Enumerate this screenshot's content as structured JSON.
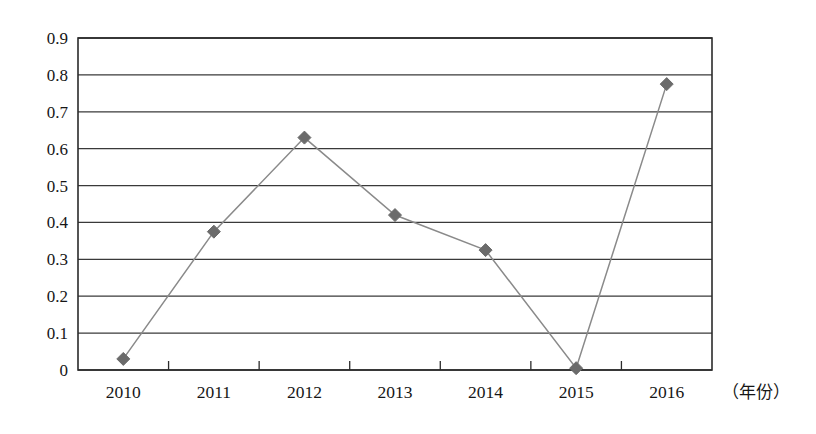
{
  "chart_data": {
    "type": "line",
    "title": "",
    "subtitle": "",
    "xlabel": "（年份）",
    "ylabel": "",
    "categories": [
      "2010",
      "2011",
      "2012",
      "2013",
      "2014",
      "2015",
      "2016"
    ],
    "values": [
      0.03,
      0.375,
      0.63,
      0.42,
      0.325,
      0.005,
      0.775
    ],
    "series": [
      {
        "name": "",
        "values": [
          0.03,
          0.375,
          0.63,
          0.42,
          0.325,
          0.005,
          0.775
        ]
      }
    ],
    "ylim": [
      0,
      0.9
    ],
    "ytick_labels": [
      "0.9",
      "0.8",
      "0.7",
      "0.6",
      "0.5",
      "0.4",
      "0.3",
      "0.2",
      "0.1",
      "0"
    ],
    "ytick_values": [
      0.9,
      0.8,
      0.7,
      0.6,
      0.5,
      0.4,
      0.3,
      0.2,
      0.1,
      0
    ],
    "ystep": 0.1,
    "grid": "horizontal",
    "legend": "none",
    "marker": "diamond",
    "marker_color": "#6b6b6b",
    "line_color": "#8a8a8a",
    "axis_color": "#2b2b2b",
    "grid_color": "#3a3a3a",
    "background": "#ffffff"
  }
}
